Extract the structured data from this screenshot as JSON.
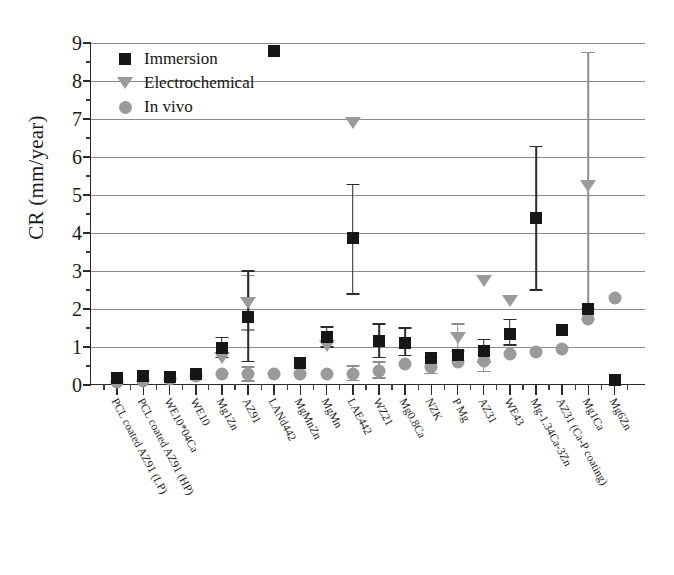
{
  "chart_data": {
    "type": "scatter",
    "title": "",
    "xlabel": "",
    "ylabel": "CR (mm/year)",
    "ylim": [
      0,
      9
    ],
    "ytick_step": 1,
    "yminor_step": 0.5,
    "grid": true,
    "grid_axis": "y",
    "legend_position": "top-left",
    "ytick_labels": [
      "0",
      "1",
      "2",
      "3",
      "4",
      "5",
      "6",
      "7",
      "8",
      "9"
    ],
    "categories": [
      "PCL coated AZ91 (LP)",
      "PCL coated AZ91 (HP)",
      "WE10*04Ca",
      "WE10",
      "Mg1Zn",
      "AZ91",
      "LANd442",
      "MgMnZn",
      "MgMn",
      "LAE442",
      "WZ21",
      "Mg0.8Ca",
      "NZK",
      "P Mg",
      "AZ31",
      "WE43",
      "Mg-1.34Ca-3Zn",
      "AZ31 (Ca-P coating)",
      "Mg1Ca",
      "Mg6Zn"
    ],
    "series": [
      {
        "name": "Immersion",
        "marker": "square",
        "color": "#161616",
        "points": [
          {
            "category": "PCL coated AZ91 (LP)",
            "value": 0.18
          },
          {
            "category": "PCL coated AZ91 (HP)",
            "value": 0.25
          },
          {
            "category": "WE10*04Ca",
            "value": 0.2
          },
          {
            "category": "WE10",
            "value": 0.3
          },
          {
            "category": "Mg1Zn",
            "value": 0.98,
            "err_low": 0.72,
            "err_high": 1.25
          },
          {
            "category": "AZ91",
            "value": 1.78,
            "err_low": 0.62,
            "err_high": 3.0
          },
          {
            "category": "LANd442",
            "value": 8.8
          },
          {
            "category": "MgMnZn",
            "value": 0.57
          },
          {
            "category": "MgMn",
            "value": 1.27,
            "err_low": 1.0,
            "err_high": 1.53
          },
          {
            "category": "LAE442",
            "value": 3.88,
            "err_low": 2.4,
            "err_high": 5.28
          },
          {
            "category": "WZ21",
            "value": 1.15,
            "err_low": 0.72,
            "err_high": 1.6
          },
          {
            "category": "Mg0.8Ca",
            "value": 1.1,
            "err_low": 0.78,
            "err_high": 1.5
          },
          {
            "category": "NZK",
            "value": 0.7
          },
          {
            "category": "P Mg",
            "value": 0.78
          },
          {
            "category": "AZ31",
            "value": 0.9,
            "err_low": 0.6,
            "err_high": 1.2
          },
          {
            "category": "WE43",
            "value": 1.35,
            "err_low": 1.05,
            "err_high": 1.72
          },
          {
            "category": "Mg-1.34Ca-3Zn",
            "value": 4.4,
            "err_low": 2.5,
            "err_high": 6.28
          },
          {
            "category": "AZ31 (Ca-P coating)",
            "value": 1.46
          },
          {
            "category": "Mg1Ca",
            "value": 2.0
          },
          {
            "category": "Mg6Zn",
            "value": 0.12
          }
        ]
      },
      {
        "name": "Electrochemical",
        "marker": "triangle-down",
        "color": "#9a9a9a",
        "points": [
          {
            "category": "Mg1Zn",
            "value": 0.72
          },
          {
            "category": "AZ91",
            "value": 2.15,
            "err_low": 1.45,
            "err_high": 2.88
          },
          {
            "category": "MgMn",
            "value": 1.02
          },
          {
            "category": "LAE442",
            "value": 6.9
          },
          {
            "category": "P Mg",
            "value": 1.25,
            "err_low": 0.9,
            "err_high": 1.6
          },
          {
            "category": "AZ31",
            "value": 2.75
          },
          {
            "category": "WE43",
            "value": 2.2
          },
          {
            "category": "Mg1Ca",
            "value": 5.25,
            "err_low": 2.0,
            "err_high": 8.75
          }
        ]
      },
      {
        "name": "In vivo",
        "marker": "circle",
        "color": "#9a9a9a",
        "points": [
          {
            "category": "PCL coated AZ91 (LP)",
            "value": 0.09
          },
          {
            "category": "PCL coated AZ91 (HP)",
            "value": 0.1
          },
          {
            "category": "WE10*04Ca",
            "value": 0.16
          },
          {
            "category": "WE10",
            "value": 0.25
          },
          {
            "category": "Mg1Zn",
            "value": 0.28
          },
          {
            "category": "AZ91",
            "value": 0.28,
            "err_low": 0.1,
            "err_high": 0.48
          },
          {
            "category": "LANd442",
            "value": 0.28
          },
          {
            "category": "MgMnZn",
            "value": 0.3
          },
          {
            "category": "MgMn",
            "value": 0.3
          },
          {
            "category": "LAE442",
            "value": 0.3,
            "err_low": 0.12,
            "err_high": 0.5
          },
          {
            "category": "WZ21",
            "value": 0.38,
            "err_low": 0.18,
            "err_high": 0.6
          },
          {
            "category": "Mg0.8Ca",
            "value": 0.55
          },
          {
            "category": "NZK",
            "value": 0.48,
            "err_low": 0.3,
            "err_high": 0.72
          },
          {
            "category": "P Mg",
            "value": 0.6
          },
          {
            "category": "AZ31",
            "value": 0.62,
            "err_low": 0.35,
            "err_high": 0.8
          },
          {
            "category": "WE43",
            "value": 0.82
          },
          {
            "category": "Mg-1.34Ca-3Zn",
            "value": 0.88
          },
          {
            "category": "AZ31 (Ca-P coating)",
            "value": 0.95
          },
          {
            "category": "Mg1Ca",
            "value": 1.75
          },
          {
            "category": "Mg6Zn",
            "value": 2.3
          }
        ]
      }
    ]
  },
  "legend": {
    "items": [
      {
        "label": "Immersion",
        "marker": "square"
      },
      {
        "label": "Electrochemical",
        "marker": "triangle-down"
      },
      {
        "label": "In vivo",
        "marker": "circle"
      }
    ]
  }
}
